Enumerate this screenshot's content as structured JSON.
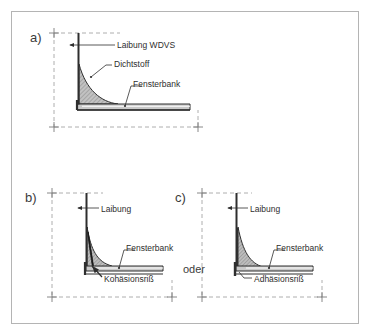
{
  "figure": {
    "background_color": "#ffffff",
    "border_color": "#b4b4b4",
    "line_color": "#2e2e2e",
    "dashed_color": "#8a8a8a",
    "hatch_fill_color": "#b9b9b9",
    "sill_fill_color": "#c9c9c9",
    "connector_text": "oder"
  },
  "panels": [
    {
      "letter": "a)",
      "labels": [
        {
          "text": "Laibung  WDVS",
          "name": "label-laibung-wdvs"
        },
        {
          "text": "Dichtstoff",
          "name": "label-dichtstoff"
        },
        {
          "text": "Fensterbank",
          "name": "label-fensterbank"
        }
      ]
    },
    {
      "letter": "b)",
      "labels": [
        {
          "text": "Laibung",
          "name": "label-laibung"
        },
        {
          "text": "Fensterbank",
          "name": "label-fensterbank"
        },
        {
          "text": "Kohäsionsriß",
          "name": "label-kohaesionsriss"
        }
      ]
    },
    {
      "letter": "c)",
      "labels": [
        {
          "text": "Laibung",
          "name": "label-laibung"
        },
        {
          "text": "Fensterbank",
          "name": "label-fensterbank"
        },
        {
          "text": "Adhäsionsriß",
          "name": "label-adhaesionsriss"
        }
      ]
    }
  ]
}
